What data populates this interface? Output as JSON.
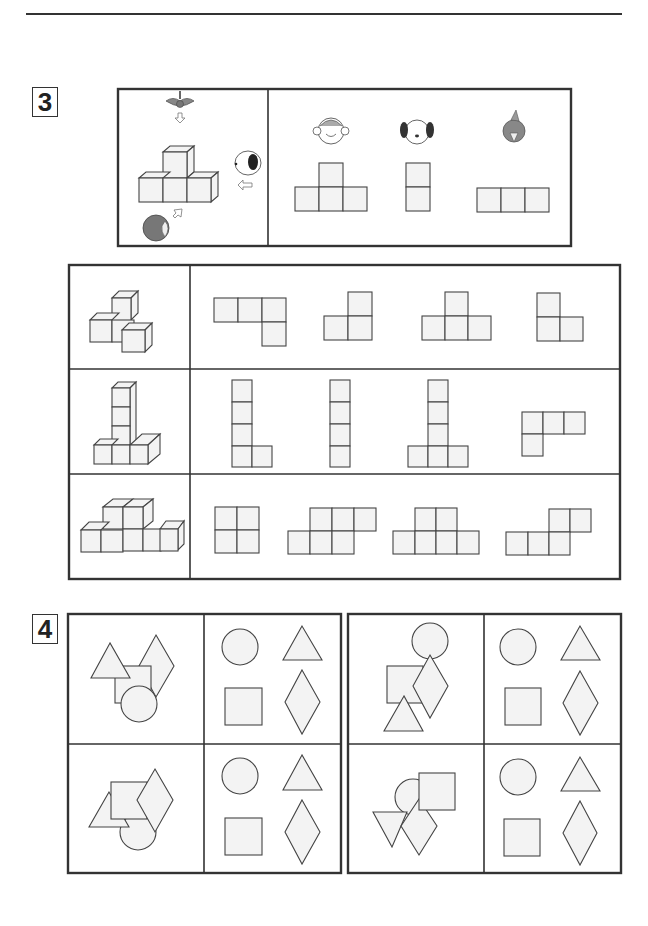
{
  "page": {
    "header_rule": true
  },
  "question3": {
    "number": "3",
    "example": {
      "viewers": [
        {
          "name": "bird",
          "direction": "top",
          "icon": "bird-icon"
        },
        {
          "name": "dog",
          "direction": "right",
          "icon": "dog-icon"
        },
        {
          "name": "penguin",
          "direction": "front-left",
          "icon": "penguin-icon"
        }
      ],
      "views": [
        {
          "viewer": "monkey",
          "icon": "monkey-icon",
          "shape": "T-shape 4 squares"
        },
        {
          "viewer": "dog",
          "icon": "dog-icon",
          "shape": "vertical 2 squares"
        },
        {
          "viewer": "bird",
          "icon": "bird-face-icon",
          "shape": "horizontal 3 squares"
        }
      ]
    },
    "rows": [
      {
        "label": "row-1",
        "options": [
          "option-a",
          "option-b",
          "option-c",
          "option-d"
        ]
      },
      {
        "label": "row-2",
        "options": [
          "option-a",
          "option-b",
          "option-c",
          "option-d"
        ]
      },
      {
        "label": "row-3",
        "options": [
          "option-a",
          "option-b",
          "option-c",
          "option-d"
        ]
      }
    ]
  },
  "question4": {
    "number": "4",
    "panels": [
      {
        "label": "panel-top-left",
        "choices": [
          "circle",
          "triangle",
          "square",
          "diamond"
        ]
      },
      {
        "label": "panel-bottom-left",
        "choices": [
          "circle",
          "triangle",
          "square",
          "diamond"
        ]
      },
      {
        "label": "panel-top-right",
        "choices": [
          "circle",
          "triangle",
          "square",
          "diamond"
        ]
      },
      {
        "label": "panel-bottom-right",
        "choices": [
          "circle",
          "triangle",
          "square",
          "diamond"
        ]
      }
    ]
  }
}
